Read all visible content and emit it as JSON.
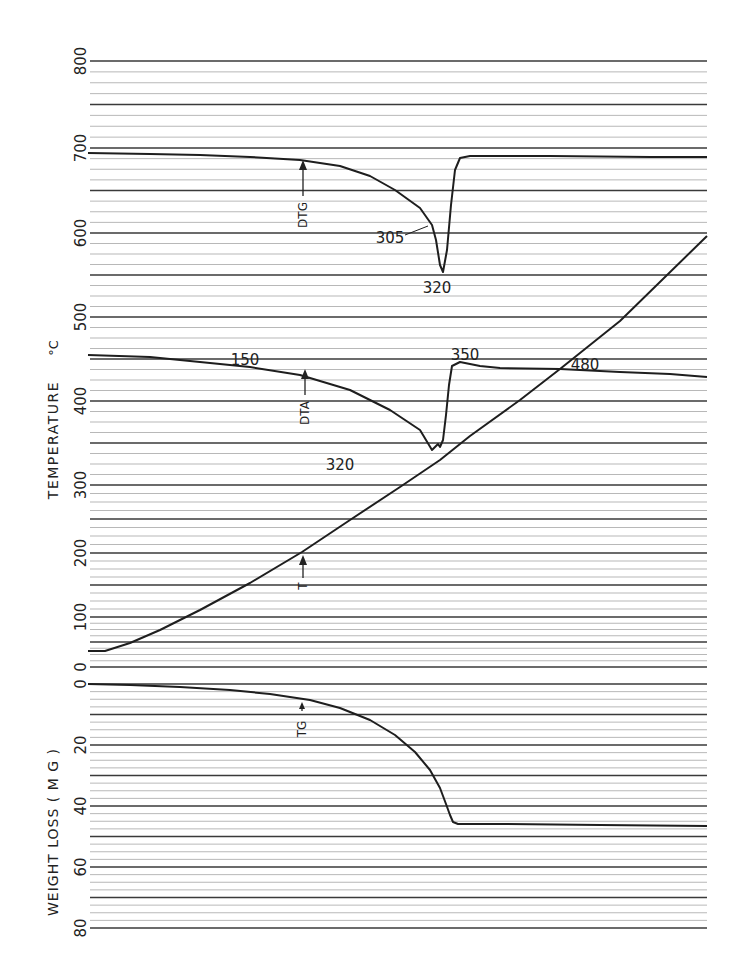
{
  "chart_data": {
    "type": "line",
    "title": "",
    "panels": [
      {
        "name": "temperature-panel",
        "ylabel": "TEMPERATURE °C",
        "ylim": [
          0,
          800
        ],
        "yticks": [
          0,
          100,
          200,
          300,
          400,
          500,
          600,
          700,
          800
        ],
        "tick_y_px": {
          "0": 667,
          "100": 617,
          "200": 553,
          "300": 485,
          "400": 401,
          "500": 317,
          "600": 233,
          "700": 148,
          "800": 61
        },
        "grid": true,
        "series": [
          {
            "name": "DTG",
            "label": "DTG",
            "annotations": [
              {
                "text": "305",
                "x": 395,
                "y": 232
              },
              {
                "text": "320",
                "x": 437,
                "y": 288
              }
            ],
            "points_px": [
              [
                88,
                153
              ],
              [
                150,
                154
              ],
              [
                200,
                155
              ],
              [
                250,
                157
              ],
              [
                300,
                160
              ],
              [
                340,
                166
              ],
              [
                370,
                176
              ],
              [
                395,
                190
              ],
              [
                420,
                208
              ],
              [
                432,
                225
              ],
              [
                436,
                240
              ],
              [
                440,
                265
              ],
              [
                443,
                272
              ],
              [
                447,
                250
              ],
              [
                451,
                205
              ],
              [
                455,
                170
              ],
              [
                460,
                158
              ],
              [
                470,
                156
              ],
              [
                550,
                156
              ],
              [
                650,
                157
              ],
              [
                707,
                157
              ]
            ]
          },
          {
            "name": "DTA",
            "label": "DTA",
            "annotations": [
              {
                "text": "150",
                "x": 243,
                "y": 364
              },
              {
                "text": "320",
                "x": 345,
                "y": 465
              },
              {
                "text": "350",
                "x": 452,
                "y": 359
              },
              {
                "text": "480",
                "x": 574,
                "y": 369
              }
            ],
            "points_px": [
              [
                88,
                355
              ],
              [
                150,
                357
              ],
              [
                200,
                362
              ],
              [
                250,
                367
              ],
              [
                300,
                375
              ],
              [
                350,
                390
              ],
              [
                390,
                410
              ],
              [
                420,
                430
              ],
              [
                432,
                450
              ],
              [
                438,
                444
              ],
              [
                440,
                447
              ],
              [
                443,
                440
              ],
              [
                446,
                415
              ],
              [
                449,
                385
              ],
              [
                452,
                366
              ],
              [
                460,
                362
              ],
              [
                470,
                364
              ],
              [
                480,
                366
              ],
              [
                500,
                368
              ],
              [
                560,
                369
              ],
              [
                620,
                372
              ],
              [
                670,
                374
              ],
              [
                707,
                377
              ]
            ]
          },
          {
            "name": "T",
            "label": "T",
            "annotations": [],
            "points_px": [
              [
                88,
                651
              ],
              [
                105,
                651
              ],
              [
                130,
                643
              ],
              [
                160,
                630
              ],
              [
                200,
                610
              ],
              [
                250,
                583
              ],
              [
                302,
                552
              ],
              [
                350,
                520
              ],
              [
                400,
                487
              ],
              [
                440,
                460
              ],
              [
                470,
                436
              ],
              [
                520,
                400
              ],
              [
                560,
                369
              ],
              [
                620,
                321
              ],
              [
                707,
                236
              ]
            ]
          }
        ]
      },
      {
        "name": "weight-loss-panel",
        "ylabel": "WEIGHT LOSS (MG)",
        "ylim": [
          0,
          80
        ],
        "yticks": [
          0,
          20,
          40,
          60,
          80
        ],
        "tick_y_px": {
          "0": 684,
          "20": 745,
          "40": 806,
          "60": 867,
          "80": 928
        },
        "grid": true,
        "series": [
          {
            "name": "TG",
            "label": "TG",
            "annotations": [],
            "points_px": [
              [
                88,
                684
              ],
              [
                130,
                685
              ],
              [
                180,
                687
              ],
              [
                230,
                690
              ],
              [
                270,
                694
              ],
              [
                310,
                700
              ],
              [
                340,
                708
              ],
              [
                370,
                720
              ],
              [
                395,
                735
              ],
              [
                415,
                752
              ],
              [
                430,
                770
              ],
              [
                440,
                788
              ],
              [
                446,
                804
              ],
              [
                450,
                815
              ],
              [
                453,
                822
              ],
              [
                458,
                824
              ],
              [
                500,
                824
              ],
              [
                600,
                825
              ],
              [
                707,
                826
              ]
            ]
          }
        ]
      }
    ],
    "arrow_labels": [
      {
        "text": "DTG",
        "x": 302,
        "y_arrow_top": 165,
        "y_label": 210
      },
      {
        "text": "DTA",
        "x": 302,
        "y_arrow_top": 372,
        "y_label": 412
      },
      {
        "text": "T",
        "x": 302,
        "y_arrow_top": 556,
        "y_label": 585
      },
      {
        "text": "TG",
        "x": 302,
        "y_arrow_top": 705,
        "y_label": 728
      }
    ]
  },
  "axis": {
    "temp_label": "TEMPERATURE",
    "temp_unit": "°C",
    "weight_label": "WEIGHT  LOSS  ( M G )",
    "temp_ticks": [
      "800",
      "700",
      "600",
      "500",
      "400",
      "300",
      "200",
      "100",
      "0"
    ],
    "weight_ticks": [
      "0",
      "20",
      "40",
      "60",
      "80"
    ]
  },
  "annotations": {
    "dtg_305": "305",
    "dtg_320": "320",
    "dta_150": "150",
    "dta_320": "320",
    "dta_350": "350",
    "dta_480": "480",
    "curve_dtg": "DTG",
    "curve_dta": "DTA",
    "curve_t": "T",
    "curve_tg": "TG"
  },
  "colors": {
    "ink": "#1e1e1e",
    "grid_major": "#3a3a3a",
    "grid_minor": "#9a9a9a",
    "paper": "#ffffff"
  }
}
